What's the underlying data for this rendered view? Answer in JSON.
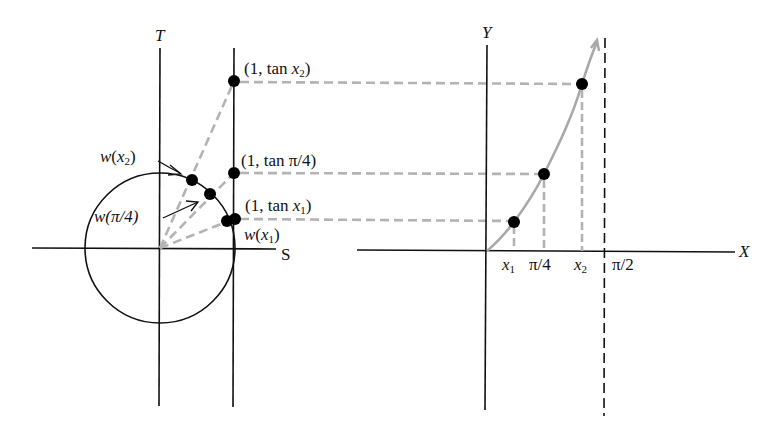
{
  "left_panel": {
    "axis_vertical_label": "T",
    "axis_horizontal_label": "S",
    "points": [
      {
        "id": "tan_x2",
        "label_pre": "(1, tan ",
        "label_var": "x",
        "label_sub": "2",
        "label_post": ")"
      },
      {
        "id": "tan_pi4",
        "label": "(1, tan π/4)"
      },
      {
        "id": "tan_x1",
        "label_pre": "(1, tan ",
        "label_var": "x",
        "label_sub": "1",
        "label_post": ")"
      }
    ],
    "circle_points": [
      {
        "id": "w_x2",
        "label_fn": "w",
        "label_var": "x",
        "label_sub": "2"
      },
      {
        "id": "w_pi4",
        "label": "w(π/4)"
      },
      {
        "id": "w_x1",
        "label_fn": "w",
        "label_var": "x",
        "label_sub": "1"
      }
    ]
  },
  "right_panel": {
    "axis_vertical_label": "Y",
    "axis_horizontal_label": "X",
    "x_ticks": [
      {
        "var": "x",
        "sub": "1"
      },
      {
        "label": "π/4"
      },
      {
        "var": "x",
        "sub": "2"
      },
      {
        "label": "π/2"
      }
    ],
    "curve": "y = tan x",
    "asymptote": "x = π/2"
  },
  "colors": {
    "axis": "#111111",
    "dashed": "#b3b3b3",
    "curve": "#a8a8a8",
    "point": "#000000"
  }
}
